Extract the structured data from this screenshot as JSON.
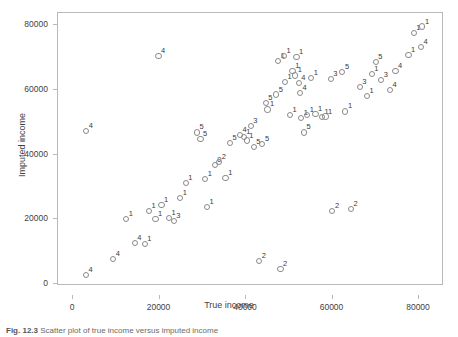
{
  "chart_data": {
    "type": "scatter",
    "title": "",
    "xlabel": "True income",
    "ylabel": "Imputed income",
    "xlim": [
      0,
      95000
    ],
    "ylim": [
      0,
      85000
    ],
    "xticks": [
      0,
      20000,
      40000,
      60000,
      80000
    ],
    "yticks": [
      0,
      20000,
      40000,
      60000,
      80000
    ],
    "xtick_labels": [
      "0",
      "20000",
      "40000",
      "60000",
      "80000"
    ],
    "ytick_labels": [
      "0",
      "20000",
      "40000",
      "60000",
      "80000"
    ],
    "grid": false,
    "legend": "none",
    "marker": "open-circle",
    "point_label_meaning": "imputation-number",
    "points": [
      {
        "x": 3200,
        "y": 2500,
        "label": "4"
      },
      {
        "x": 3300,
        "y": 47000,
        "label": "4"
      },
      {
        "x": 9500,
        "y": 7500,
        "label": "4"
      },
      {
        "x": 12500,
        "y": 19800,
        "label": "1"
      },
      {
        "x": 14500,
        "y": 12300,
        "label": "4"
      },
      {
        "x": 16800,
        "y": 12000,
        "label": "1"
      },
      {
        "x": 17800,
        "y": 22300,
        "label": "1"
      },
      {
        "x": 19300,
        "y": 19800,
        "label": "1"
      },
      {
        "x": 20000,
        "y": 70000,
        "label": "4"
      },
      {
        "x": 20700,
        "y": 24200,
        "label": "1"
      },
      {
        "x": 22400,
        "y": 20100,
        "label": "1"
      },
      {
        "x": 23500,
        "y": 19200,
        "label": "3"
      },
      {
        "x": 25000,
        "y": 26300,
        "label": "1"
      },
      {
        "x": 26300,
        "y": 30800,
        "label": "1"
      },
      {
        "x": 28900,
        "y": 46500,
        "label": "5"
      },
      {
        "x": 29700,
        "y": 44500,
        "label": "5"
      },
      {
        "x": 30800,
        "y": 32000,
        "label": "1"
      },
      {
        "x": 31200,
        "y": 23400,
        "label": "1"
      },
      {
        "x": 33000,
        "y": 36500,
        "label": "0"
      },
      {
        "x": 34000,
        "y": 37300,
        "label": "2"
      },
      {
        "x": 35500,
        "y": 32500,
        "label": "1"
      },
      {
        "x": 36500,
        "y": 43300,
        "label": "5"
      },
      {
        "x": 38800,
        "y": 45700,
        "label": "4"
      },
      {
        "x": 39700,
        "y": 45000,
        "label": "1"
      },
      {
        "x": 40400,
        "y": 44000,
        "label": "1"
      },
      {
        "x": 41300,
        "y": 48500,
        "label": "3"
      },
      {
        "x": 42000,
        "y": 42000,
        "label": "5"
      },
      {
        "x": 43300,
        "y": 6800,
        "label": "2"
      },
      {
        "x": 44000,
        "y": 43000,
        "label": "5"
      },
      {
        "x": 44800,
        "y": 55500,
        "label": "5"
      },
      {
        "x": 45200,
        "y": 53600,
        "label": "1"
      },
      {
        "x": 47200,
        "y": 58200,
        "label": "5"
      },
      {
        "x": 47600,
        "y": 68500,
        "label": "1"
      },
      {
        "x": 48200,
        "y": 4300,
        "label": "2"
      },
      {
        "x": 49000,
        "y": 70000,
        "label": "1"
      },
      {
        "x": 49200,
        "y": 62200,
        "label": "1"
      },
      {
        "x": 50400,
        "y": 51800,
        "label": "1"
      },
      {
        "x": 51000,
        "y": 65500,
        "label": "1"
      },
      {
        "x": 51600,
        "y": 64100,
        "label": "1"
      },
      {
        "x": 51900,
        "y": 69700,
        "label": "1"
      },
      {
        "x": 52400,
        "y": 61700,
        "label": "4"
      },
      {
        "x": 52700,
        "y": 58700,
        "label": "4"
      },
      {
        "x": 53000,
        "y": 51000,
        "label": "1"
      },
      {
        "x": 53600,
        "y": 46500,
        "label": "5"
      },
      {
        "x": 54400,
        "y": 51800,
        "label": "1"
      },
      {
        "x": 55300,
        "y": 63300,
        "label": "1"
      },
      {
        "x": 56300,
        "y": 52200,
        "label": "1"
      },
      {
        "x": 57800,
        "y": 51300,
        "label": "1"
      },
      {
        "x": 58600,
        "y": 51400,
        "label": "1"
      },
      {
        "x": 59800,
        "y": 63000,
        "label": "3"
      },
      {
        "x": 60200,
        "y": 22300,
        "label": "2"
      },
      {
        "x": 62500,
        "y": 65200,
        "label": "5"
      },
      {
        "x": 63200,
        "y": 53000,
        "label": "1"
      },
      {
        "x": 64500,
        "y": 22800,
        "label": "2"
      },
      {
        "x": 66500,
        "y": 60500,
        "label": "3"
      },
      {
        "x": 68200,
        "y": 57700,
        "label": "1"
      },
      {
        "x": 69300,
        "y": 64600,
        "label": "1"
      },
      {
        "x": 70200,
        "y": 68300,
        "label": "5"
      },
      {
        "x": 71500,
        "y": 62700,
        "label": "3"
      },
      {
        "x": 73500,
        "y": 59500,
        "label": "4"
      },
      {
        "x": 74800,
        "y": 65500,
        "label": "4"
      },
      {
        "x": 77800,
        "y": 70500,
        "label": "1"
      },
      {
        "x": 79000,
        "y": 77200,
        "label": "1"
      },
      {
        "x": 80700,
        "y": 73000,
        "label": "4"
      },
      {
        "x": 81000,
        "y": 79200,
        "label": "1"
      },
      {
        "x": 91500,
        "y": 76800,
        "label": "4"
      }
    ]
  },
  "caption": {
    "number": "Fig. 12.3",
    "text": "Scatter plot of true income versus imputed income"
  }
}
